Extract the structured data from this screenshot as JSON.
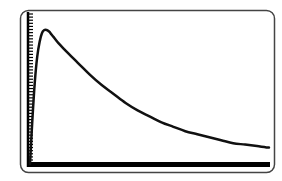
{
  "chart_data": {
    "type": "line",
    "title": "",
    "xlabel": "",
    "ylabel": "",
    "grid": false,
    "legend": null,
    "xlim": [
      0,
      100
    ],
    "ylim": [
      0,
      100
    ],
    "y_tick_count": 48,
    "series": [
      {
        "name": "curve",
        "x": [
          0,
          1,
          2,
          3,
          4,
          5,
          6,
          7,
          8,
          9,
          10,
          12,
          15,
          20,
          25,
          30,
          35,
          40,
          45,
          50,
          55,
          60,
          65,
          70,
          75,
          80,
          85,
          90,
          95,
          100
        ],
        "y": [
          0,
          30,
          55,
          72,
          82,
          88,
          90,
          90,
          89,
          87,
          85,
          81,
          76,
          68,
          60,
          53,
          47,
          41,
          36,
          32,
          28,
          25,
          22,
          20,
          18,
          16,
          14,
          13,
          12,
          11
        ]
      }
    ],
    "colors": {
      "frame": "#444444",
      "axis": "#000000",
      "curve": "#111111",
      "background": "#ffffff"
    }
  }
}
